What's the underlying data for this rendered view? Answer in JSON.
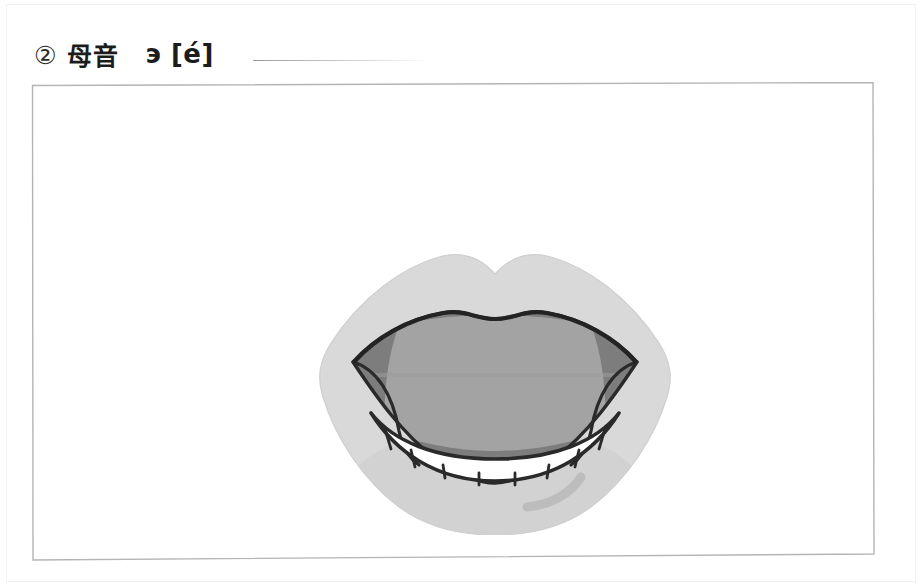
{
  "page": {
    "background_color": "#ffffff",
    "width": 920,
    "height": 586
  },
  "header": {
    "item_number": "②",
    "title_cjk": "母音",
    "title_cyrillic": "э [é]",
    "rule_color": "#9a9a9a"
  },
  "frame": {
    "border_color": "#b4b4b4",
    "fill_color": "#ffffff"
  },
  "illustration": {
    "name": "open-mouth-vowel-diagram",
    "alt": "Front view of an open mouth articulating the Russian vowel э, lips spread wide, lower teeth visible, tongue mid-low",
    "colors": {
      "lips": "#d9d9d9",
      "lip_shade": "#c4c4c4",
      "oral_cavity_corner": "#7d7d7d",
      "tongue": "#a3a3a3",
      "teeth": "#ffffff",
      "outline": "#2a2a2a"
    },
    "parts": [
      {
        "name": "upper-lip",
        "label": "Upper lip with cupid's bow"
      },
      {
        "name": "lower-lip",
        "label": "Lower lip"
      },
      {
        "name": "left-corner-cavity",
        "label": "Left oral cavity corner"
      },
      {
        "name": "right-corner-cavity",
        "label": "Right oral cavity corner"
      },
      {
        "name": "tongue-body",
        "label": "Tongue body"
      },
      {
        "name": "lower-teeth",
        "label": "Lower teeth row"
      },
      {
        "name": "lip-highlight",
        "label": "Lower lip shading stroke"
      }
    ],
    "teeth_count": 8
  }
}
